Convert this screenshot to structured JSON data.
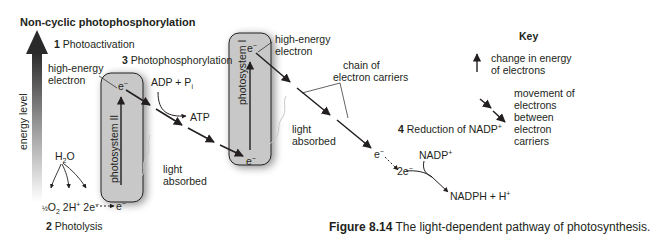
{
  "title": "Non-cyclic photophosphorylation",
  "axis": {
    "label": "energy level"
  },
  "steps": [
    {
      "num": "1",
      "label": "Photoactivation"
    },
    {
      "num": "2",
      "label": "Photolysis"
    },
    {
      "num": "3",
      "label": "Photophosphorylation"
    },
    {
      "num": "4",
      "label": "Reduction of NADP"
    }
  ],
  "photosystems": [
    {
      "label": "photosystem II"
    },
    {
      "label": "photosystem I"
    }
  ],
  "labels": {
    "high_energy_1": "high-energy",
    "high_energy_1b": "electron",
    "high_energy_2": "high-energy",
    "high_energy_2b": "electron",
    "adp": "ADP + P",
    "adp_sub": "i",
    "atp": "ATP",
    "light1a": "light",
    "light1b": "absorbed",
    "light2a": "light",
    "light2b": "absorbed",
    "chain_a": "chain of",
    "chain_b": "electron carriers",
    "water": "H",
    "water_sub": "2",
    "water_end": "O",
    "half_o2": "O",
    "half_o2_sub": "2",
    "protons": "2H",
    "electrons_2": "2e",
    "electron": "e",
    "nadp": "NADP",
    "nadph": "NADPH + H",
    "two_e": "2e",
    "plus": "+",
    "minus": "−"
  },
  "key": {
    "title": "Key",
    "items": [
      {
        "icon": "up-arrow",
        "lines": [
          "change in energy",
          "of electrons"
        ]
      },
      {
        "icon": "dashed-down-arrow",
        "lines": [
          "movement of",
          "electrons",
          "between",
          "electron",
          "carriers"
        ]
      }
    ]
  },
  "caption": {
    "figure": "Figure 8.14",
    "text": "The light-dependent pathway of photosynthesis."
  }
}
